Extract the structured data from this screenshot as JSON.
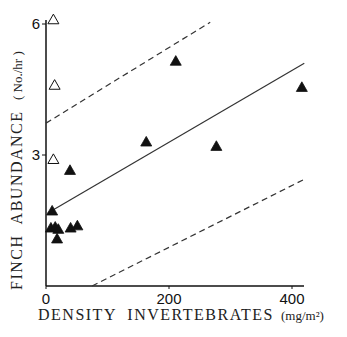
{
  "chart_data": {
    "type": "scatter",
    "title": "",
    "xlabel": "DENSITY  INVERTEBRATES",
    "xlabel_unit": "(mg/m²)",
    "ylabel": "FINCH  ABUNDANCE",
    "ylabel_unit": "( No./hr )",
    "xlim": [
      0,
      420
    ],
    "ylim": [
      0,
      6
    ],
    "xticks": [
      0,
      200,
      400
    ],
    "xtick_labels": [
      "0",
      "200",
      "400"
    ],
    "yticks": [
      3,
      6
    ],
    "ytick_labels": [
      "3",
      "6"
    ],
    "grid": false,
    "legend": null,
    "series": [
      {
        "name": "open-triangles",
        "marker": "open-triangle",
        "points": [
          [
            12,
            6.1
          ],
          [
            14,
            4.6
          ],
          [
            12,
            2.9
          ]
        ]
      },
      {
        "name": "filled-triangles",
        "marker": "filled-triangle",
        "points": [
          [
            10,
            1.72
          ],
          [
            8,
            1.33
          ],
          [
            15,
            1.35
          ],
          [
            20,
            1.3
          ],
          [
            18,
            1.08
          ],
          [
            40,
            1.33
          ],
          [
            51,
            1.38
          ],
          [
            39,
            2.65
          ],
          [
            163,
            3.3
          ],
          [
            211,
            5.15
          ],
          [
            277,
            3.2
          ],
          [
            416,
            4.55
          ]
        ]
      }
    ],
    "lines": [
      {
        "name": "regression",
        "style": "solid",
        "points": [
          [
            3,
            1.67
          ],
          [
            420,
            5.1
          ]
        ]
      },
      {
        "name": "upper-confidence",
        "style": "dashed",
        "points": [
          [
            0,
            3.73
          ],
          [
            267,
            6.04
          ]
        ]
      },
      {
        "name": "lower-confidence",
        "style": "dashed",
        "points": [
          [
            75,
            0
          ],
          [
            418,
            2.43
          ]
        ]
      }
    ]
  }
}
